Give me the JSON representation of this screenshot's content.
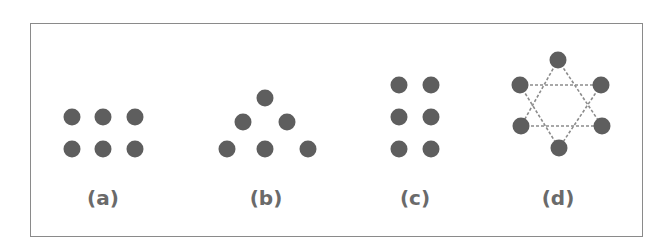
{
  "figure": {
    "dot_color": "#5e5e5e",
    "line_color": "#8c8c8c",
    "label_color": "#6a6a6a",
    "frame_color": "#8a8a8a",
    "panels": [
      {
        "id": "a",
        "label": "(a)",
        "label_x": 103,
        "arrangement": "2 rows x 3 columns grid",
        "dots": [
          [
            72,
            117
          ],
          [
            103,
            117
          ],
          [
            135,
            117
          ],
          [
            72,
            149
          ],
          [
            103,
            149
          ],
          [
            135,
            149
          ]
        ]
      },
      {
        "id": "b",
        "label": "(b)",
        "label_x": 266,
        "arrangement": "triangle (1-2-3)",
        "dots": [
          [
            265,
            98
          ],
          [
            243,
            122
          ],
          [
            287,
            122
          ],
          [
            227,
            149
          ],
          [
            265,
            149
          ],
          [
            308,
            149
          ]
        ]
      },
      {
        "id": "c",
        "label": "(c)",
        "label_x": 415,
        "arrangement": "3 rows x 2 columns grid",
        "dots": [
          [
            399,
            85
          ],
          [
            431,
            85
          ],
          [
            399,
            117
          ],
          [
            431,
            117
          ],
          [
            399,
            149
          ],
          [
            431,
            149
          ]
        ]
      },
      {
        "id": "d",
        "label": "(d)",
        "label_x": 558,
        "arrangement": "hexagon with dashed triangles (star of David)",
        "dots": [
          [
            558,
            60
          ],
          [
            520,
            85
          ],
          [
            601,
            85
          ],
          [
            521,
            126
          ],
          [
            602,
            126
          ],
          [
            559,
            148
          ]
        ],
        "dashed_lines": [
          [
            [
              520,
              85
            ],
            [
              601,
              85
            ]
          ],
          [
            [
              520,
              85
            ],
            [
              559,
              148
            ]
          ],
          [
            [
              601,
              85
            ],
            [
              559,
              148
            ]
          ],
          [
            [
              558,
              60
            ],
            [
              521,
              126
            ]
          ],
          [
            [
              558,
              60
            ],
            [
              602,
              126
            ]
          ],
          [
            [
              521,
              126
            ],
            [
              602,
              126
            ]
          ]
        ]
      }
    ]
  }
}
